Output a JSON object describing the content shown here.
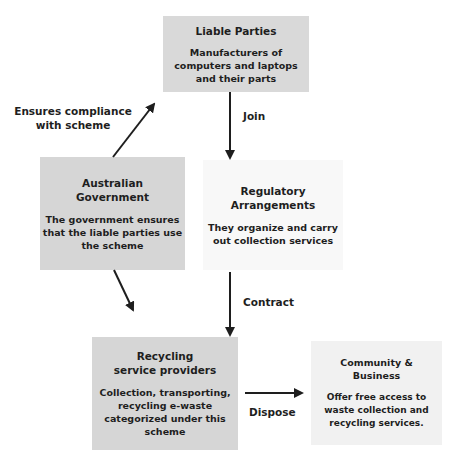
{
  "nodes": {
    "liable_parties": {
      "title": "Liable Parties",
      "description": "Manufacturers of computers and laptops and their parts"
    },
    "australian_government": {
      "title_line1": "Australian",
      "title_line2": "Government",
      "description": "The government ensures that the liable parties use the scheme"
    },
    "regulatory_arrangements": {
      "title_line1": "Regulatory",
      "title_line2": "Arrangements",
      "description": "They organize and carry out collection services"
    },
    "recycling_service_providers": {
      "title_line1": "Recycling",
      "title_line2": "service providers",
      "description": "Collection, transporting, recycling e-waste categorized under this scheme"
    },
    "community_business": {
      "title_line1": "Community &",
      "title_line2": "Business",
      "description": "Offer free access to waste collection and recycling services."
    }
  },
  "edges": {
    "gov_to_liable": {
      "label_line1": "Ensures compliance",
      "label_line2": "with scheme"
    },
    "liable_to_reg": {
      "label": "Join"
    },
    "reg_to_rec": {
      "label": "Contract"
    },
    "gov_to_rec": {
      "label": ""
    },
    "rec_to_com": {
      "label": "Dispose"
    }
  },
  "colors": {
    "dark_box": "#d6d6d6",
    "light_box": "#f8f8f8",
    "arrow": "#1e1e1e"
  }
}
